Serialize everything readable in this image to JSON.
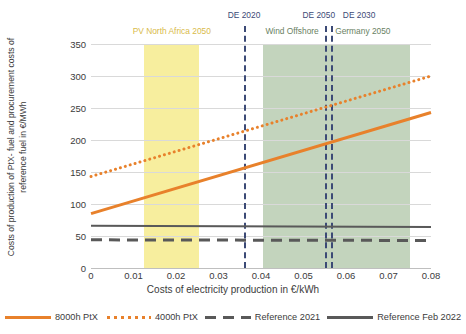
{
  "chart_data": {
    "type": "line",
    "title": "",
    "xlabel": "Costs of electricity production in €/kWh",
    "ylabel": "Costs of production of PtX- fuel and procurement costs of reference fuel in €/MWh",
    "xlim": [
      0,
      0.08
    ],
    "ylim": [
      0,
      350
    ],
    "xticks": [
      "0",
      "0.01",
      "0.02",
      "0.03",
      "0.04",
      "0.05",
      "0.06",
      "0.07",
      "0.08"
    ],
    "xtick_values": [
      0,
      0.01,
      0.02,
      0.03,
      0.04,
      0.05,
      0.06,
      0.07,
      0.08
    ],
    "yticks": [
      "0",
      "50",
      "100",
      "150",
      "200",
      "250",
      "300",
      "350"
    ],
    "ytick_values": [
      0,
      50,
      100,
      150,
      200,
      250,
      300,
      350
    ],
    "grid": "horizontal",
    "legend_position": "bottom",
    "x": [
      0,
      0.08
    ],
    "series": [
      {
        "name": "8000h PtX",
        "style": "solid",
        "color": "#e8812b",
        "values": [
          85,
          243
        ]
      },
      {
        "name": "4000h PtX",
        "style": "dotted",
        "color": "#e8812b",
        "values": [
          143,
          300
        ]
      },
      {
        "name": "Reference 2021",
        "style": "dashed",
        "color": "#595959",
        "values": [
          44,
          43
        ]
      },
      {
        "name": "Reference Feb 2022",
        "style": "solid",
        "color": "#595959",
        "values": [
          66,
          64
        ]
      }
    ],
    "bands": [
      {
        "name": "PV North Africa 2050",
        "label": "PV  North Africa 2050",
        "color": "#f7ee9e",
        "label_color": "#d9bb4a",
        "x_start": 0.0125,
        "x_end": 0.0255
      },
      {
        "name": "Wind Offshore Germany 2050",
        "label_left": "Wind Offshore",
        "label_right": "Germany 2050",
        "color": "#c3d4bd",
        "label_color": "#6a7f63",
        "x_start": 0.0405,
        "x_end": 0.075
      }
    ],
    "vlines": [
      {
        "name": "DE 2020",
        "label": "DE 2020",
        "x": 0.036,
        "color": "#3c4a76",
        "style": "dashed"
      },
      {
        "name": "DE 2050",
        "label": "DE 2050",
        "x": 0.055,
        "color": "#3c4a76",
        "style": "dashed"
      },
      {
        "name": "DE 2030",
        "label": "DE 2030",
        "x": 0.0565,
        "color": "#3c4a76",
        "style": "dashed"
      }
    ]
  },
  "legend": {
    "items": [
      {
        "label": "8000h PtX"
      },
      {
        "label": "4000h PtX"
      },
      {
        "label": "Reference 2021"
      },
      {
        "label": "Reference Feb 2022"
      }
    ]
  },
  "annotations": {
    "de_2020": "DE 2020",
    "de_2050": "DE 2050",
    "de_2030": "DE 2030",
    "pv_north_africa": "PV  North Africa 2050",
    "wind_offshore": "Wind Offshore",
    "germany_2050": "Germany 2050"
  },
  "axes": {
    "x_title": "Costs of electricity production in €/kWh",
    "y_title": "Costs of production of PtX- fuel and procurement costs of reference fuel in €/MWh"
  }
}
